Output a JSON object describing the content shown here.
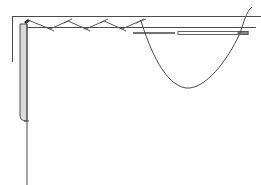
{
  "diagram": {
    "colors": {
      "line": "#4a4a4a",
      "fabric_fill": "#d9d9d9",
      "background": "#ffffff"
    },
    "elements": [
      "fabric-top-edge",
      "fabric-left-edge",
      "folded-hem",
      "cross-stitch-thread",
      "needle",
      "working-thread-loop"
    ]
  }
}
